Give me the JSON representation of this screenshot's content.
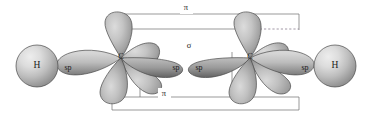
{
  "diagram": {
    "molecule": "C2H2",
    "background_color": "#ffffff"
  },
  "atoms": {
    "hydrogen_left": {
      "label": "H",
      "cx": 37,
      "cy": 66,
      "r": 21
    },
    "hydrogen_right": {
      "label": "H",
      "cx": 335,
      "cy": 66,
      "r": 21
    },
    "carbon_left": {
      "label": "C",
      "cx": 121,
      "cy": 58
    },
    "carbon_right": {
      "label": "C",
      "cx": 250,
      "cy": 58
    }
  },
  "orbital_labels": {
    "sp_left_outer": {
      "text": "sp",
      "x": 68,
      "y": 68
    },
    "sp_left_inner": {
      "text": "sp",
      "x": 176,
      "y": 68
    },
    "sp_right_inner": {
      "text": "sp",
      "x": 199,
      "y": 68
    },
    "sp_right_outer": {
      "text": "sp",
      "x": 305,
      "y": 68
    }
  },
  "bond_labels": {
    "pi_top": {
      "text": "π",
      "x": 186,
      "y": 8
    },
    "sigma_middle": {
      "text": "σ",
      "x": 189,
      "y": 46
    },
    "pi_bottom": {
      "text": "π",
      "x": 164,
      "y": 94
    }
  },
  "colors": {
    "sphere_highlight": "#e3e3e3",
    "sphere_mid": "#c3c3c3",
    "sphere_shadow": "#8c8c8c",
    "lobe_highlight": "#cfcfcf",
    "lobe_mid": "#b0b0b0",
    "lobe_shadow": "#6f6f6f",
    "outline": "#4a4a4a",
    "guide": "#6e6e6e",
    "guide_dashed": "#8a7f8f",
    "text": "#1a1a1a"
  },
  "guides": {
    "pi_top_outer": {
      "x1": 112,
      "y1": 14,
      "x2": 299,
      "y2": 14
    },
    "pi_top_inner": {
      "x1": 112,
      "y1": 29,
      "x2": 240,
      "y2": 29
    },
    "pi_top_dashed": {
      "x1": 240,
      "y1": 29,
      "x2": 299,
      "y2": 29
    },
    "pi_top_left_edge": {
      "x1": 112,
      "y1": 14,
      "x2": 112,
      "y2": 29
    },
    "pi_top_right_edge": {
      "x1": 299,
      "y1": 14,
      "x2": 299,
      "y2": 29
    },
    "pi_bottom_inner": {
      "x1": 112,
      "y1": 97,
      "x2": 299,
      "y2": 97
    },
    "pi_bottom_outer": {
      "x1": 112,
      "y1": 110,
      "x2": 299,
      "y2": 110
    },
    "pi_bottom_left_edge": {
      "x1": 112,
      "y1": 97,
      "x2": 112,
      "y2": 110
    },
    "pi_bottom_right_edge": {
      "x1": 299,
      "y1": 97,
      "x2": 299,
      "y2": 110
    },
    "sigma_left_edge": {
      "x1": 140,
      "y1": 50,
      "x2": 140,
      "y2": 97
    },
    "sigma_right_edge": {
      "x1": 232,
      "y1": 50,
      "x2": 232,
      "y2": 97
    }
  }
}
